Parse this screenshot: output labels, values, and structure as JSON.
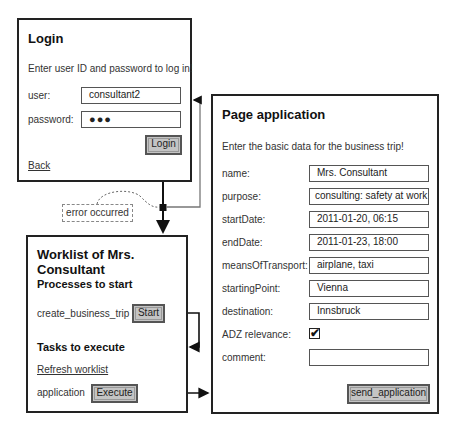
{
  "login": {
    "title": "Login",
    "instruction": "Enter user ID and password to log in!",
    "user_label": "user:",
    "user_value": "consultant2",
    "password_label": "password:",
    "password_value": "●●●",
    "login_button": "Login",
    "back_link": "Back"
  },
  "error_note": "error occurred",
  "worklist": {
    "title": "Worklist of Mrs. Consultant",
    "processes_heading": "Processes to start",
    "process_name": "create_business_trip",
    "start_button": "Start",
    "tasks_heading": "Tasks to execute",
    "refresh_link": "Refresh worklist",
    "task_name": "application",
    "execute_button": "Execute"
  },
  "page_application": {
    "title": "Page application",
    "instruction": "Enter the basic data for the business trip!",
    "fields": [
      {
        "label": "name:",
        "value": "Mrs. Consultant"
      },
      {
        "label": "purpose:",
        "value": "consulting: safety at work"
      },
      {
        "label": "startDate:",
        "value": "2011-01-20, 06:15"
      },
      {
        "label": "endDate:",
        "value": "2011-01-23, 18:00"
      },
      {
        "label": "meansOfTransport:",
        "value": "airplane, taxi"
      },
      {
        "label": "startingPoint:",
        "value": "Vienna"
      },
      {
        "label": "destination:",
        "value": "Innsbruck"
      }
    ],
    "adz_label": "ADZ relevance:",
    "adz_checked": "✔",
    "comment_label": "comment:",
    "comment_value": "",
    "send_button": "send_application"
  }
}
